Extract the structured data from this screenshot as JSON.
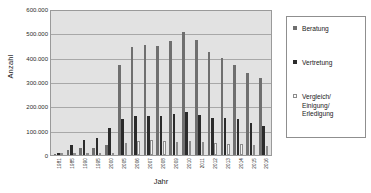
{
  "chart_data": {
    "type": "bar",
    "title": "",
    "xlabel": "Jahr",
    "ylabel": "Anzahl",
    "ylim": [
      0,
      600000
    ],
    "yticks": [
      "0",
      "100.000",
      "200.000",
      "300.000",
      "400.000",
      "500.000",
      "600.000"
    ],
    "ytick_values": [
      0,
      100000,
      200000,
      300000,
      400000,
      500000,
      600000
    ],
    "grid": true,
    "legend_position": "right",
    "categories": [
      "1981",
      "1985",
      "1990",
      "1995",
      "2000",
      "2005",
      "2006",
      "2007",
      "2008",
      "2009",
      "2010",
      "2011",
      "2012",
      "2013",
      "2014",
      "2015",
      "2016"
    ],
    "series": [
      {
        "name": "Beratung",
        "color": "#6f6f6f",
        "values": [
          6000,
          22000,
          27000,
          30000,
          42000,
          370000,
          443000,
          453000,
          448000,
          468000,
          505000,
          472000,
          424000,
          400000,
          369000,
          336000,
          315000
        ]
      },
      {
        "name": "Vertretung",
        "color": "#2b2b2b",
        "values": [
          9000,
          40000,
          62000,
          69000,
          110000,
          146000,
          160000,
          162000,
          160000,
          168000,
          175000,
          166000,
          154000,
          151000,
          148000,
          132000,
          121000
        ]
      },
      {
        "name": "Vergleich/\nEinigung/\nErledigung",
        "color": "#f4f4f4",
        "values": [
          2000,
          5000,
          6000,
          7000,
          9000,
          49000,
          58000,
          61000,
          56000,
          53000,
          57000,
          54000,
          48000,
          46000,
          47000,
          41000,
          37000
        ]
      }
    ]
  },
  "legend": {
    "items": [
      {
        "label": "Beratung"
      },
      {
        "label": "Vertretung"
      },
      {
        "label": "Vergleich/\nEinigung/\nErledigung"
      }
    ]
  }
}
